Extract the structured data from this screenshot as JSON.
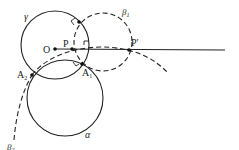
{
  "diagram": {
    "colors": {
      "stroke": "#222222",
      "background": "#ffffff"
    },
    "circles": [
      {
        "id": "gamma",
        "label": "γ",
        "style": "solid",
        "cx": 55,
        "cy": 45,
        "r": 34
      },
      {
        "id": "alpha",
        "label": "α",
        "style": "solid",
        "cx": 65,
        "cy": 98,
        "r": 38
      },
      {
        "id": "beta1",
        "label": "β",
        "sub": "1",
        "style": "dashed",
        "cx": 103,
        "cy": 42,
        "r": 29
      }
    ],
    "arcs": [
      {
        "id": "beta2",
        "label": "β",
        "sub": "2",
        "style": "dashed"
      }
    ],
    "points": [
      {
        "id": "O",
        "label": "O",
        "x": 55,
        "y": 49
      },
      {
        "id": "P",
        "label": "P",
        "x": 72,
        "y": 49
      },
      {
        "id": "P_prime",
        "label": "P′",
        "x": 129,
        "y": 50
      },
      {
        "id": "A1",
        "label": "A",
        "sub": "1",
        "x": 78,
        "y": 64
      },
      {
        "id": "A2",
        "label": "A",
        "sub": "2",
        "x": 32,
        "y": 75
      },
      {
        "id": "T",
        "label": "",
        "x": 79,
        "y": 22
      }
    ],
    "labels": {
      "gamma": "γ",
      "alpha": "α",
      "beta": "β",
      "one": "1",
      "two": "2",
      "O": "O",
      "P": "P",
      "P_prime": "P′",
      "A": "A"
    }
  }
}
